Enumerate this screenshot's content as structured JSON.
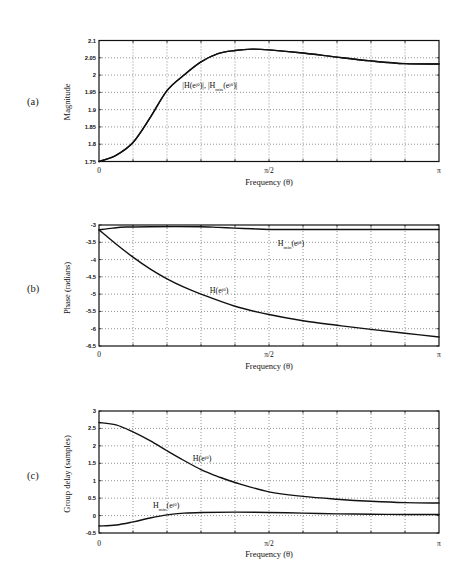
{
  "figure": {
    "panels": [
      {
        "label": "(a)",
        "ylabel": "Magnitude",
        "xlabel": "Frequency (θ)"
      },
      {
        "label": "(b)",
        "ylabel": "Phase (radians)",
        "xlabel": "Frequency (θ)"
      },
      {
        "label": "(c)",
        "ylabel": "Group delay (samples)",
        "xlabel": "Frequency (θ)"
      }
    ]
  },
  "chart_data": [
    {
      "type": "line",
      "title": "",
      "panel": "(a)",
      "xlabel": "Frequency (θ)",
      "ylabel": "Magnitude",
      "x_units": "π",
      "xlim": [
        0,
        1
      ],
      "xticks": [
        0,
        0.5,
        1
      ],
      "xtick_labels": [
        "0",
        "π/2",
        "π"
      ],
      "xgrid": [
        0.1,
        0.2,
        0.3,
        0.4,
        0.5,
        0.6,
        0.7,
        0.8,
        0.9
      ],
      "ylim": [
        1.75,
        2.1
      ],
      "yticks": [
        1.75,
        1.8,
        1.85,
        1.9,
        1.95,
        2.0,
        2.05,
        2.1
      ],
      "ytick_labels": [
        "1.75",
        "1.8",
        "1.85",
        "1.9",
        "1.95",
        "2",
        "2.05",
        "2.1"
      ],
      "grid": true,
      "legend": "none",
      "series": [
        {
          "name": "|H(e^jθ)|",
          "x": [
            0,
            0.05,
            0.1,
            0.15,
            0.2,
            0.25,
            0.3,
            0.35,
            0.4,
            0.45,
            0.5,
            0.6,
            0.7,
            0.8,
            0.9,
            1.0
          ],
          "y": [
            1.75,
            1.768,
            1.805,
            1.876,
            1.955,
            2.0,
            2.038,
            2.062,
            2.071,
            2.075,
            2.073,
            2.064,
            2.052,
            2.041,
            2.033,
            2.032
          ]
        },
        {
          "name": "|H_min(e^jθ)|",
          "x": [
            0,
            0.05,
            0.1,
            0.15,
            0.2,
            0.25,
            0.3,
            0.35,
            0.4,
            0.45,
            0.5,
            0.6,
            0.7,
            0.8,
            0.9,
            1.0
          ],
          "y": [
            1.75,
            1.768,
            1.805,
            1.876,
            1.955,
            2.0,
            2.038,
            2.062,
            2.071,
            2.075,
            2.073,
            2.064,
            2.052,
            2.041,
            2.033,
            2.032
          ]
        }
      ],
      "annotations": [
        {
          "text": "|H(e^jθ)|, |H_min(e^jθ)|",
          "x": 0.245,
          "y": 1.972,
          "segments": [
            {
              "t": "|H(e"
            },
            {
              "sup": "jθ"
            },
            {
              "t": ")|, |H"
            },
            {
              "sub": "min"
            },
            {
              "t": "(e"
            },
            {
              "sup": "jθ"
            },
            {
              "t": ")|"
            }
          ]
        }
      ]
    },
    {
      "type": "line",
      "title": "",
      "panel": "(b)",
      "xlabel": "Frequency (θ)",
      "ylabel": "Phase (radians)",
      "x_units": "π",
      "xlim": [
        0,
        1
      ],
      "xticks": [
        0,
        0.5,
        1
      ],
      "xtick_labels": [
        "0",
        "π/2",
        "π"
      ],
      "xgrid": [
        0.1,
        0.2,
        0.3,
        0.4,
        0.5,
        0.6,
        0.7,
        0.8,
        0.9
      ],
      "ylim": [
        -6.5,
        -3
      ],
      "yticks": [
        -6.5,
        -6,
        -5.5,
        -5,
        -4.5,
        -4,
        -3.5,
        -3
      ],
      "ytick_labels": [
        "-6.5",
        "-6",
        "-5.5",
        "-5",
        "-4.5",
        "-4",
        "-3.5",
        "-3"
      ],
      "grid": true,
      "legend": "none",
      "series": [
        {
          "name": "H_min(e^jθ)",
          "x": [
            0,
            0.04,
            0.08,
            0.15,
            0.3,
            0.35,
            0.4,
            0.45,
            0.5,
            0.6,
            0.8,
            1.0
          ],
          "y": [
            -3.14,
            -3.09,
            -3.06,
            -3.05,
            -3.05,
            -3.07,
            -3.09,
            -3.11,
            -3.13,
            -3.13,
            -3.13,
            -3.13
          ]
        },
        {
          "name": "H(e^jθ)",
          "x": [
            0,
            0.05,
            0.1,
            0.15,
            0.2,
            0.25,
            0.3,
            0.4,
            0.5,
            0.6,
            0.7,
            0.8,
            0.9,
            1.0
          ],
          "y": [
            -3.14,
            -3.55,
            -3.93,
            -4.27,
            -4.56,
            -4.8,
            -5.0,
            -5.35,
            -5.59,
            -5.77,
            -5.9,
            -6.02,
            -6.13,
            -6.24
          ]
        }
      ],
      "annotations": [
        {
          "text": "H_min(e^jθ)",
          "x": 0.526,
          "y": -3.52,
          "segments": [
            {
              "t": "H"
            },
            {
              "sub": "min"
            },
            {
              "t": "(e"
            },
            {
              "sup": "jθ"
            },
            {
              "t": ")"
            }
          ]
        },
        {
          "text": "H(e^jθ)",
          "x": 0.326,
          "y": -4.88,
          "segments": [
            {
              "t": "H(e"
            },
            {
              "sup": "jθ"
            },
            {
              "t": ")"
            }
          ]
        }
      ]
    },
    {
      "type": "line",
      "title": "",
      "panel": "(c)",
      "xlabel": "Frequency (θ)",
      "ylabel": "Group delay (samples)",
      "x_units": "π",
      "xlim": [
        0,
        1
      ],
      "xticks": [
        0,
        0.5,
        1
      ],
      "xtick_labels": [
        "0",
        "π/2",
        "π"
      ],
      "xgrid": [
        0.1,
        0.2,
        0.3,
        0.4,
        0.5,
        0.6,
        0.7,
        0.8,
        0.9
      ],
      "ylim": [
        -0.5,
        3
      ],
      "yticks": [
        -0.5,
        0,
        0.5,
        1,
        1.5,
        2,
        2.5,
        3
      ],
      "ytick_labels": [
        "-0.5",
        "0",
        "0.5",
        "1",
        "1.5",
        "2",
        "2.5",
        "3"
      ],
      "grid": true,
      "legend": "none",
      "series": [
        {
          "name": "H(e^jθ)",
          "x": [
            0,
            0.05,
            0.1,
            0.15,
            0.2,
            0.25,
            0.3,
            0.35,
            0.4,
            0.5,
            0.6,
            0.7,
            0.8,
            0.9,
            1.0
          ],
          "y": [
            2.67,
            2.6,
            2.4,
            2.15,
            1.86,
            1.58,
            1.32,
            1.12,
            0.95,
            0.68,
            0.55,
            0.47,
            0.41,
            0.37,
            0.36
          ]
        },
        {
          "name": "H_min(e^jθ)",
          "x": [
            0,
            0.05,
            0.1,
            0.15,
            0.2,
            0.25,
            0.3,
            0.4,
            0.5,
            0.6,
            0.7,
            0.8,
            0.9,
            1.0
          ],
          "y": [
            -0.3,
            -0.27,
            -0.18,
            -0.07,
            0.02,
            0.07,
            0.09,
            0.1,
            0.09,
            0.07,
            0.05,
            0.04,
            0.03,
            0.03
          ]
        }
      ],
      "annotations": [
        {
          "text": "H(e^jθ)",
          "x": 0.276,
          "y": 1.652,
          "segments": [
            {
              "t": "H(e"
            },
            {
              "sup": "jθ"
            },
            {
              "t": ")"
            }
          ]
        },
        {
          "text": "H_min(e^jθ)",
          "x": 0.159,
          "y": 0.303,
          "segments": [
            {
              "t": "H"
            },
            {
              "sub": "min"
            },
            {
              "t": "(e"
            },
            {
              "sup": "jθ"
            },
            {
              "t": ")"
            }
          ]
        }
      ]
    }
  ]
}
